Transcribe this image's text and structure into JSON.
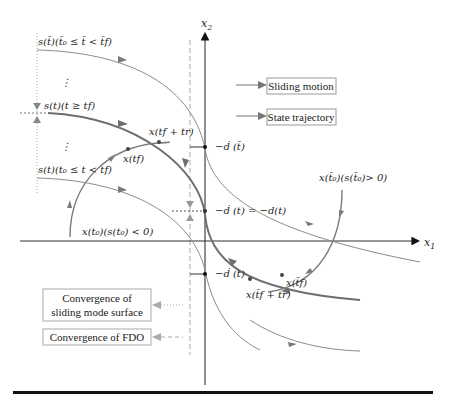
{
  "axes": {
    "x_label": "x",
    "x_sub": "1",
    "y_label": "x",
    "y_sub": "2"
  },
  "legend_top": {
    "items": [
      {
        "label": "Sliding motion",
        "line_style": "solid-thick"
      },
      {
        "label": "State trajectory",
        "line_style": "solid-thin"
      }
    ]
  },
  "legend_bottom": {
    "items": [
      {
        "label_line1": "Convergence of",
        "label_line2": "sliding mode surface",
        "line_style": "dotted"
      },
      {
        "label_line1": "Convergence of FDO",
        "line_style": "dashed"
      }
    ]
  },
  "surface_labels": {
    "upper": "s(t̄)(t̄₀ ≤ t̄ < t̄f)",
    "middle": "s(t)(t ≥ tf)",
    "lower": "s(t)(t₀ ≤ t < tf)",
    "ellipsis": "⋮"
  },
  "point_labels": {
    "x_tf_plus_tr_upper": "x(tf + tr)",
    "x_tf_upper": "x(tf)",
    "x_t0_lower": "x(t₀)(s(t₀) < 0)",
    "x_t0_bar": "x(t̄₀)(s(t̄₀)> 0)",
    "x_tf_bar": "x(t̄f)",
    "x_tf_plus_tr_bar": "x(t̄f + tr)"
  },
  "axis_marks": {
    "d_bar": "−ḋ (t̄)",
    "d_mid": "−ḋ (t) = −d(t)",
    "d_under": "−ḋ (t)"
  },
  "colors": {
    "axis": "#333333",
    "thick_curve": "#6e6e6e",
    "thin_curve": "#8c8c8c",
    "arrow": "#7a7a7a",
    "box_border": "#999999",
    "dashed": "#aaaaaa",
    "bottom_rule": "#111111"
  }
}
